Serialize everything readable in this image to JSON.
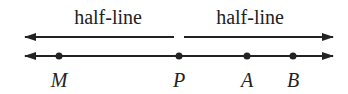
{
  "diagram": {
    "half_line_labels": [
      "half-line",
      "half-line"
    ],
    "points": [
      {
        "label": "M",
        "x": 59
      },
      {
        "label": "P",
        "x": 179
      },
      {
        "label": "A",
        "x": 247
      },
      {
        "label": "B",
        "x": 293
      }
    ],
    "colors": {
      "ink": "#222222",
      "background": "#ffffff"
    }
  }
}
